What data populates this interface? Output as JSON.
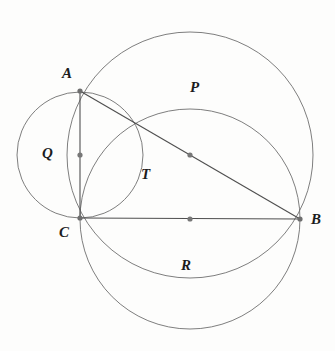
{
  "figure": {
    "width": 335,
    "height": 351,
    "background_color": "#fdfdfc",
    "stroke_color": "#6b6b6b",
    "chord_color": "#555555",
    "dot_color": "#707070",
    "label_color": "#1c1c1c"
  },
  "points": {
    "A": {
      "label": "A",
      "x": 80,
      "y": 91,
      "label_x": 62,
      "label_y": 66
    },
    "B": {
      "label": "B",
      "x": 300,
      "y": 219,
      "label_x": 311,
      "label_y": 212
    },
    "C": {
      "label": "C",
      "x": 80,
      "y": 218,
      "label_x": 59,
      "label_y": 225
    },
    "mid_AC": {
      "label": "",
      "x": 80,
      "y": 155
    },
    "mid_AB": {
      "label": "",
      "x": 190,
      "y": 155
    },
    "mid_CB": {
      "label": "",
      "x": 190,
      "y": 219
    }
  },
  "circles": [
    {
      "name": "P",
      "label": "P",
      "cx": 190,
      "cy": 155,
      "r": 123,
      "diameter_endpoints": [
        "A",
        "B"
      ],
      "label_x": 190,
      "label_y": 80
    },
    {
      "name": "Q",
      "label": "Q",
      "cx": 80,
      "cy": 155,
      "r": 63,
      "diameter_endpoints": [
        "A",
        "C"
      ],
      "label_x": 42,
      "label_y": 146
    },
    {
      "name": "R",
      "label": "R",
      "cx": 190,
      "cy": 219,
      "r": 110,
      "diameter_endpoints": [
        "C",
        "B"
      ],
      "label_x": 181,
      "label_y": 258
    }
  ],
  "triangle": {
    "name": "T",
    "label": "T",
    "vertices": [
      "A",
      "B",
      "C"
    ],
    "label_x": 141,
    "label_y": 167
  },
  "segments": [
    {
      "name": "segment-AB",
      "from": "A",
      "to": "B"
    },
    {
      "name": "segment-AC",
      "from": "A",
      "to": "C"
    },
    {
      "name": "segment-CB",
      "from": "C",
      "to": "B"
    }
  ]
}
